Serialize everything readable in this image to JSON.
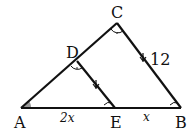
{
  "diagram": {
    "type": "geometry-similar-triangles",
    "points": {
      "A": {
        "label": "A",
        "x": 21,
        "y": 108
      },
      "B": {
        "label": "B",
        "x": 181,
        "y": 108
      },
      "C": {
        "label": "C",
        "x": 117,
        "y": 23
      },
      "D": {
        "label": "D",
        "x": 77,
        "y": 61
      },
      "E": {
        "label": "E",
        "x": 115,
        "y": 108
      }
    },
    "segments": [
      "AB",
      "AC",
      "BC",
      "DE"
    ],
    "labels": {
      "AE": "2x",
      "EB": "x",
      "BC": "12"
    },
    "marks": {
      "parallel": [
        "DE",
        "BC"
      ],
      "equal_angles_arc": [
        "C",
        "D"
      ],
      "equal_angles_small": [
        "E",
        "B"
      ],
      "shaded_angle": "A"
    },
    "colors": {
      "line": "#111111",
      "shade": "#9a9a9a"
    }
  }
}
